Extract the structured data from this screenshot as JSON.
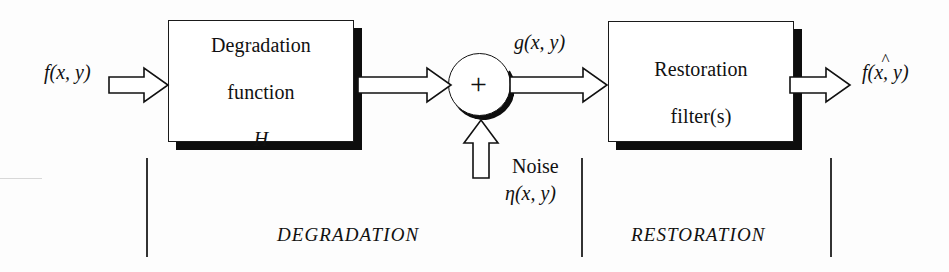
{
  "figure": {
    "type": "block-diagram",
    "background_color": "#fdfdfd",
    "ink_color": "#111111",
    "shadow_color": "#0d0d0d"
  },
  "inputs": {
    "source_signal": "f(x, y)",
    "source_signal_parts": {
      "func": "f",
      "open": "(",
      "x": "x",
      "comma": ", ",
      "y": "y",
      "close": ")"
    }
  },
  "blocks": [
    {
      "id": "degradation-function",
      "line1": "Degradation",
      "line2": "function",
      "symbol": "H"
    },
    {
      "id": "restoration-filter",
      "line1": "Restoration",
      "line2": "filter(s)"
    }
  ],
  "summing_junction": {
    "operator": "+",
    "name": "summing-junction"
  },
  "signals": {
    "degraded": "g(x, y)",
    "output": "f(x, y)",
    "output_hat": "^",
    "noise_label": "Noise",
    "noise_symbol": "η(x, y)"
  },
  "sections": [
    {
      "id": "degradation",
      "caption": "DEGRADATION"
    },
    {
      "id": "restoration",
      "caption": "RESTORATION"
    }
  ],
  "icons": {
    "arrow_input": "block-arrow-right-icon",
    "arrow_to_sum": "block-arrow-right-icon",
    "arrow_to_filter": "block-arrow-right-icon",
    "arrow_output": "block-arrow-right-icon",
    "arrow_noise": "block-arrow-up-icon"
  }
}
